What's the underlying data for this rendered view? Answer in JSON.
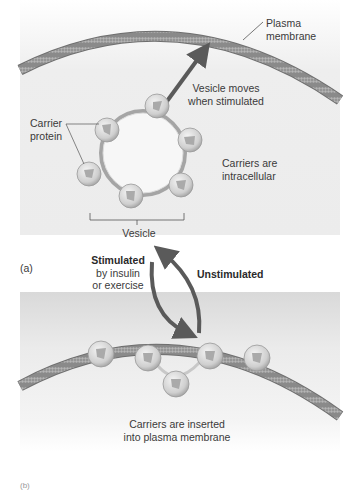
{
  "figure": {
    "panel_a": {
      "label": "(a)",
      "plasma_membrane_label_line1": "Plasma",
      "plasma_membrane_label_line2": "membrane",
      "vesicle_moves_line1": "Vesicle moves",
      "vesicle_moves_line2": "when stimulated",
      "carrier_protein_line1": "Carrier",
      "carrier_protein_line2": "protein",
      "carriers_intracellular_line1": "Carriers are",
      "carriers_intracellular_line2": "intracellular",
      "vesicle_label": "Vesicle"
    },
    "transition": {
      "stimulated_bold": "Stimulated",
      "stimulated_line2": "by insulin",
      "stimulated_line3": "or exercise",
      "unstimulated": "Unstimulated"
    },
    "panel_b": {
      "label": "(b)",
      "carriers_inserted_line1": "Carriers are inserted",
      "carriers_inserted_line2": "into plasma membrane"
    },
    "colors": {
      "membrane": "#7a7a7a",
      "arrow": "#5a5a5a",
      "carrier": "#d8d8d8",
      "background": "#ececec"
    }
  }
}
